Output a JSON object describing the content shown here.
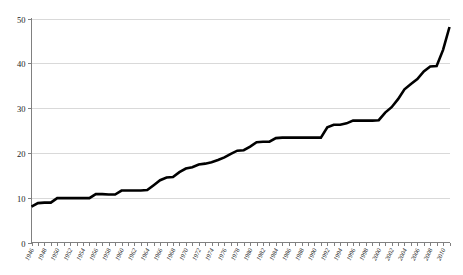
{
  "chart_data": {
    "type": "line",
    "title": "",
    "subtitle": "",
    "xlabel": "",
    "ylabel": "",
    "xlim": [
      1946,
      2011
    ],
    "ylim": [
      0,
      50
    ],
    "grid": true,
    "legend": false,
    "legend_position": "none",
    "series_color": "#000000",
    "grid_color": "#d9d9d9",
    "axis_color": "#808080",
    "background": "#ffffff",
    "yticks": [
      0,
      10,
      20,
      30,
      40,
      50
    ],
    "ytick_labels": [
      "0",
      "10",
      "20",
      "30",
      "40",
      "50"
    ],
    "xtick_labels": [
      "1946",
      "1948",
      "1950",
      "1952",
      "1954",
      "1956",
      "1958",
      "1960",
      "1962",
      "1964",
      "1966",
      "1968",
      "1970",
      "1972",
      "1974",
      "1976",
      "1978",
      "1980",
      "1982",
      "1984",
      "1986",
      "1988",
      "1990",
      "1992",
      "1994",
      "1996",
      "1998",
      "2000",
      "2002",
      "2004",
      "2006",
      "2008",
      "2010"
    ],
    "xtick_step": 2,
    "x": [
      1946,
      1947,
      1948,
      1949,
      1950,
      1951,
      1952,
      1953,
      1954,
      1955,
      1956,
      1957,
      1958,
      1959,
      1960,
      1961,
      1962,
      1963,
      1964,
      1965,
      1966,
      1967,
      1968,
      1969,
      1970,
      1971,
      1972,
      1973,
      1974,
      1975,
      1976,
      1977,
      1978,
      1979,
      1980,
      1981,
      1982,
      1983,
      1984,
      1985,
      1986,
      1987,
      1988,
      1989,
      1990,
      1991,
      1992,
      1993,
      1994,
      1995,
      1996,
      1997,
      1998,
      1999,
      2000,
      2001,
      2002,
      2003,
      2004,
      2005,
      2006,
      2007,
      2008,
      2009,
      2010,
      2011
    ],
    "values": [
      8.0,
      8.8,
      8.9,
      8.9,
      9.9,
      9.9,
      9.9,
      9.9,
      9.9,
      9.9,
      10.8,
      10.8,
      10.7,
      10.7,
      11.6,
      11.6,
      11.6,
      11.6,
      11.7,
      12.8,
      13.9,
      14.5,
      14.6,
      15.7,
      16.5,
      16.8,
      17.4,
      17.6,
      17.9,
      18.4,
      19.0,
      19.8,
      20.5,
      20.6,
      21.4,
      22.4,
      22.5,
      22.5,
      23.3,
      23.4,
      23.4,
      23.4,
      23.4,
      23.4,
      23.4,
      23.4,
      25.7,
      26.3,
      26.3,
      26.6,
      27.2,
      27.2,
      27.2,
      27.2,
      27.3,
      29.0,
      30.2,
      32.0,
      34.2,
      35.4,
      36.5,
      38.2,
      39.3,
      39.4,
      43.0,
      48.1
    ],
    "series": [
      {
        "name": "series-1",
        "values": [
          8.0,
          8.8,
          8.9,
          8.9,
          9.9,
          9.9,
          9.9,
          9.9,
          9.9,
          9.9,
          10.8,
          10.8,
          10.7,
          10.7,
          11.6,
          11.6,
          11.6,
          11.6,
          11.7,
          12.8,
          13.9,
          14.5,
          14.6,
          15.7,
          16.5,
          16.8,
          17.4,
          17.6,
          17.9,
          18.4,
          19.0,
          19.8,
          20.5,
          20.6,
          21.4,
          22.4,
          22.5,
          22.5,
          23.3,
          23.4,
          23.4,
          23.4,
          23.4,
          23.4,
          23.4,
          23.4,
          25.7,
          26.3,
          26.3,
          26.6,
          27.2,
          27.2,
          27.2,
          27.2,
          27.3,
          29.0,
          30.2,
          32.0,
          34.2,
          35.4,
          36.5,
          38.2,
          39.3,
          39.4,
          43.0,
          48.1
        ]
      }
    ]
  }
}
